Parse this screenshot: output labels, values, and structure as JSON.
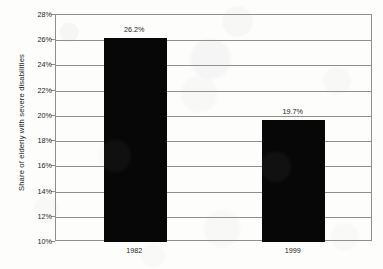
{
  "chart_data": {
    "type": "bar",
    "title": "",
    "subtitle": "",
    "xlabel": "",
    "ylabel": "Share of elderly with severe disabilities",
    "categories": [
      "1982",
      "1999"
    ],
    "values": [
      26.2,
      19.7
    ],
    "value_labels": [
      "26.2%",
      "19.7%"
    ],
    "ylim": [
      10,
      28
    ],
    "ytick_step": 2,
    "ytick_labels": [
      "28%",
      "26%",
      "24%",
      "22%",
      "20%",
      "18%",
      "16%",
      "14%",
      "12%",
      "10%"
    ],
    "ytick_values": [
      28,
      26,
      24,
      22,
      20,
      18,
      16,
      14,
      12,
      10
    ],
    "grid": true,
    "legend": false,
    "legend_position": "none",
    "series": [
      {
        "name": "Share of elderly with severe disabilities",
        "values": [
          26.2,
          19.7
        ],
        "color": "#070707"
      }
    ],
    "colors": {
      "bar": "#070707",
      "gridline": "#8f8f8f",
      "axis": "#8f8f8f",
      "text": "#1d1d1d",
      "background": "#fdfdfc"
    }
  }
}
